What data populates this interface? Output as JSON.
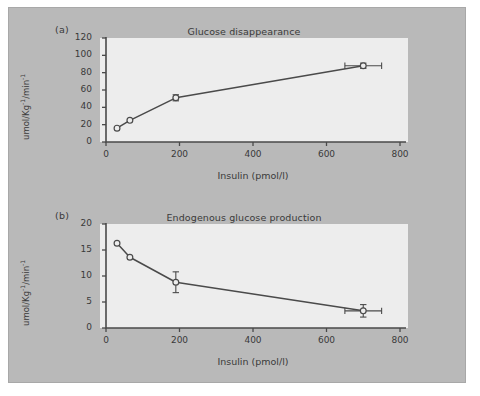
{
  "figure": {
    "background_color": "#b9b9b9",
    "plot_background_color": "#ededed",
    "line_color": "#4a4a4a",
    "panels": [
      {
        "label": "(a)"
      },
      {
        "label": "(b)"
      }
    ]
  },
  "chart_data": [
    {
      "type": "line",
      "panel": "(a)",
      "title": "Glucose disappearance",
      "xlabel": "Insulin (pmol/l)",
      "ylabel": "umol/Kg⁻¹/min⁻¹",
      "ylabel_parts": {
        "pre": "umol/Kg",
        "sup1": "-1",
        "mid": "/min",
        "sup2": "-1"
      },
      "xlim": [
        0,
        800
      ],
      "ylim": [
        0,
        120
      ],
      "xticks": [
        0,
        200,
        400,
        600,
        800
      ],
      "yticks": [
        0,
        20,
        40,
        60,
        80,
        100,
        120
      ],
      "xtick_labels": [
        "0",
        "200",
        "400",
        "600",
        "800"
      ],
      "ytick_labels": [
        "0",
        "20",
        "40",
        "60",
        "80",
        "100",
        "120"
      ],
      "grid": false,
      "legend": "none",
      "marker": "open-circle",
      "x": [
        30,
        65,
        190,
        700
      ],
      "y": [
        16,
        25,
        51,
        88
      ],
      "yerr": [
        0,
        0,
        3.5,
        3.0
      ],
      "xerr": [
        0,
        0,
        0,
        50
      ]
    },
    {
      "type": "line",
      "panel": "(b)",
      "title": "Endogenous glucose production",
      "xlabel": "Insulin (pmol/l)",
      "ylabel": "umol/Kg⁻¹/min⁻¹",
      "ylabel_parts": {
        "pre": "umol/Kg",
        "sup1": "-1",
        "mid": "/min",
        "sup2": "-1"
      },
      "xlim": [
        0,
        800
      ],
      "ylim": [
        0,
        20
      ],
      "xticks": [
        0,
        200,
        400,
        600,
        800
      ],
      "yticks": [
        0,
        5,
        10,
        15,
        20
      ],
      "xtick_labels": [
        "0",
        "200",
        "400",
        "600",
        "800"
      ],
      "ytick_labels": [
        "0",
        "5",
        "10",
        "15",
        "20"
      ],
      "grid": false,
      "legend": "none",
      "marker": "open-circle",
      "x": [
        30,
        65,
        190,
        700
      ],
      "y": [
        16.3,
        13.6,
        8.8,
        3.3
      ],
      "yerr": [
        0,
        0,
        2.0,
        1.2
      ],
      "xerr": [
        0,
        0,
        0,
        50
      ]
    }
  ]
}
